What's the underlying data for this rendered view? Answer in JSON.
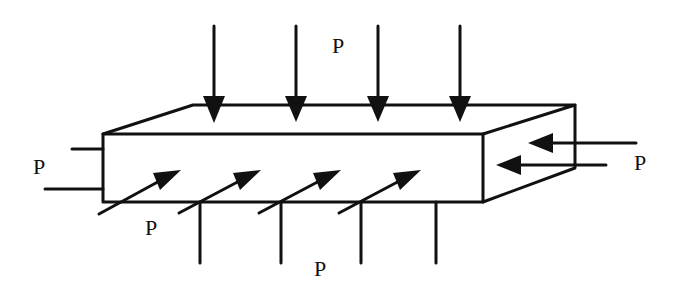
{
  "diagram": {
    "type": "rectangular block under uniform pressure on all sides",
    "labels": {
      "top": "P",
      "left": "P",
      "right": "P",
      "front": "P",
      "bottom": "P"
    },
    "colors": {
      "ink": "#111111",
      "background": "#ffffff"
    },
    "arrows": {
      "top_count": 4,
      "front_count": 4,
      "right_count": 2
    }
  }
}
